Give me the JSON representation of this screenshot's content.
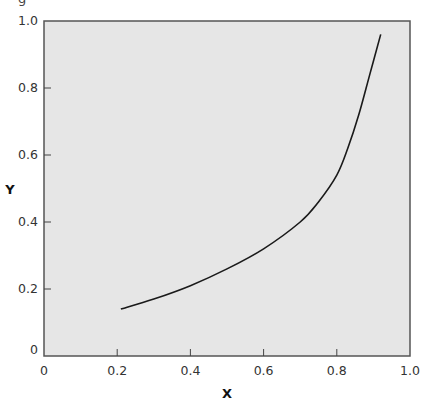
{
  "top_cut_text": "g",
  "chart_data": {
    "type": "line",
    "title": "",
    "xlabel": "X",
    "ylabel": "Y",
    "xlim": [
      0,
      1.0
    ],
    "ylim": [
      0,
      1.0
    ],
    "x_ticks": [
      "0",
      "0.2",
      "0.4",
      "0.6",
      "0.8",
      "1.0"
    ],
    "y_ticks": [
      "0",
      "0.2",
      "0.4",
      "0.6",
      "0.8",
      "1.0"
    ],
    "grid": false,
    "legend": null,
    "background_color": "#e6e6e6",
    "line_color": "#1a1a1a",
    "series": [
      {
        "name": "curve",
        "x": [
          0.21,
          0.3,
          0.4,
          0.5,
          0.6,
          0.7,
          0.75,
          0.8,
          0.83,
          0.86,
          0.89,
          0.92
        ],
        "y": [
          0.14,
          0.17,
          0.21,
          0.26,
          0.32,
          0.4,
          0.46,
          0.54,
          0.62,
          0.72,
          0.84,
          0.96
        ]
      }
    ]
  }
}
